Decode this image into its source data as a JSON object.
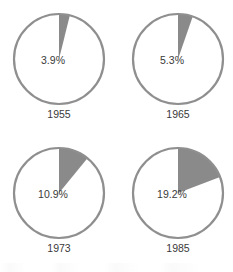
{
  "chart_data": {
    "type": "pie",
    "title": "",
    "subtitle": "",
    "xlabel": "",
    "ylabel": "",
    "legend": [],
    "grid": false,
    "start_angle_deg": 0,
    "direction": "clockwise",
    "colors": {
      "slice_fill": "#8a8a8a",
      "remainder_fill": "#ffffff",
      "outline": "#8f8f8f",
      "label_text": "#3a3a3a",
      "background": "#ffffff"
    },
    "charts": [
      {
        "year": "1955",
        "value": 3.9,
        "value_label": "3.9%",
        "remainder": 96.1,
        "slice_angle_deg": 14.0
      },
      {
        "year": "1965",
        "value": 5.3,
        "value_label": "5.3%",
        "remainder": 94.7,
        "slice_angle_deg": 19.1
      },
      {
        "year": "1973",
        "value": 10.9,
        "value_label": "10.9%",
        "remainder": 89.1,
        "slice_angle_deg": 39.2
      },
      {
        "year": "1985",
        "value": 19.2,
        "value_label": "19.2%",
        "remainder": 80.8,
        "slice_angle_deg": 69.1
      }
    ]
  }
}
